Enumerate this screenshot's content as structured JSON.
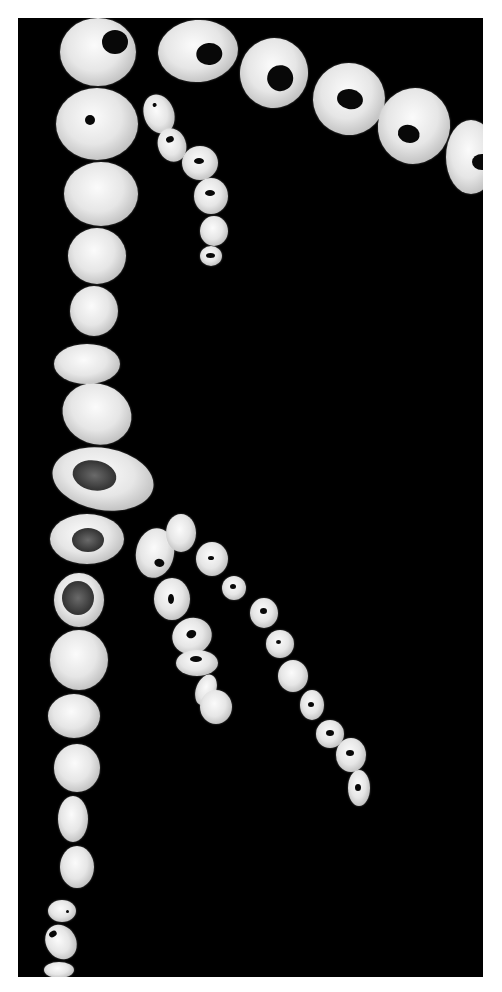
{
  "image": {
    "description": "Photograph of serial arterial cross-section slices arranged in chains on a black background",
    "background": "#000000",
    "border_color": "#ffffff",
    "segment_color": "#e6e6e6",
    "lumen_color": "#080808"
  },
  "chains": [
    {
      "name": "top-row-large-rings",
      "segments": [
        {
          "x": 140,
          "y": 2,
          "w": 80,
          "h": 62,
          "lumen": {
            "x": 38,
            "y": 24,
            "w": 26,
            "h": 22
          },
          "rot": -5
        },
        {
          "x": 222,
          "y": 20,
          "w": 68,
          "h": 70,
          "lumen": {
            "x": 28,
            "y": 26,
            "w": 26,
            "h": 26
          },
          "rot": 10
        },
        {
          "x": 295,
          "y": 45,
          "w": 72,
          "h": 72,
          "lumen": {
            "x": 24,
            "y": 26,
            "w": 26,
            "h": 20
          },
          "rot": 10
        },
        {
          "x": 360,
          "y": 70,
          "w": 72,
          "h": 76,
          "lumen": {
            "x": 22,
            "y": 38,
            "w": 22,
            "h": 18
          },
          "rot": 15
        },
        {
          "x": 428,
          "y": 102,
          "w": 50,
          "h": 74,
          "lumen": {
            "x": 26,
            "y": 34,
            "w": 20,
            "h": 16
          },
          "rot": 0
        }
      ]
    },
    {
      "name": "left-column",
      "segments": [
        {
          "x": 42,
          "y": 0,
          "w": 76,
          "h": 68,
          "lumen": {
            "x": 42,
            "y": 12,
            "w": 26,
            "h": 24
          },
          "rot": 0
        },
        {
          "x": 38,
          "y": 70,
          "w": 82,
          "h": 72,
          "lumen": {
            "x": 29,
            "y": 27,
            "w": 10,
            "h": 10
          },
          "rot": 0
        },
        {
          "x": 46,
          "y": 144,
          "w": 74,
          "h": 64,
          "lumen": null,
          "rot": 0
        },
        {
          "x": 50,
          "y": 210,
          "w": 58,
          "h": 56,
          "lumen": null,
          "rot": 0
        },
        {
          "x": 52,
          "y": 268,
          "w": 48,
          "h": 50,
          "lumen": null,
          "rot": 0
        },
        {
          "x": 36,
          "y": 326,
          "w": 66,
          "h": 40,
          "lumen": null,
          "rot": 0
        },
        {
          "x": 44,
          "y": 366,
          "w": 70,
          "h": 60,
          "lumen": null,
          "rot": 20
        },
        {
          "x": 34,
          "y": 430,
          "w": 102,
          "h": 62,
          "plaque": {
            "x": 20,
            "y": 14,
            "w": 44,
            "h": 30
          },
          "rot": 10
        },
        {
          "x": 32,
          "y": 496,
          "w": 74,
          "h": 50,
          "plaque": {
            "x": 22,
            "y": 14,
            "w": 32,
            "h": 24
          },
          "rot": 0
        },
        {
          "x": 36,
          "y": 555,
          "w": 50,
          "h": 54,
          "plaque": {
            "x": 8,
            "y": 8,
            "w": 32,
            "h": 34
          },
          "rot": 0
        },
        {
          "x": 32,
          "y": 612,
          "w": 58,
          "h": 60,
          "lumen": null,
          "rot": 0
        },
        {
          "x": 30,
          "y": 676,
          "w": 52,
          "h": 44,
          "lumen": null,
          "rot": 0
        },
        {
          "x": 36,
          "y": 726,
          "w": 46,
          "h": 48,
          "lumen": null,
          "rot": 0
        },
        {
          "x": 40,
          "y": 778,
          "w": 30,
          "h": 46,
          "lumen": null,
          "rot": 0
        },
        {
          "x": 42,
          "y": 828,
          "w": 34,
          "h": 42,
          "lumen": null,
          "rot": 0
        },
        {
          "x": 30,
          "y": 882,
          "w": 28,
          "h": 22,
          "lumen": {
            "x": 18,
            "y": 10,
            "w": 3,
            "h": 3
          },
          "rot": 0
        },
        {
          "x": 28,
          "y": 906,
          "w": 30,
          "h": 36,
          "lumen": {
            "x": 8,
            "y": 4,
            "w": 8,
            "h": 6
          },
          "rot": -30
        },
        {
          "x": 26,
          "y": 944,
          "w": 30,
          "h": 16,
          "lumen": null,
          "rot": 0
        }
      ]
    },
    {
      "name": "upper-small-chain",
      "segments": [
        {
          "x": 126,
          "y": 76,
          "w": 30,
          "h": 40,
          "lumen": {
            "x": 12,
            "y": 8,
            "w": 4,
            "h": 4
          },
          "rot": -20
        },
        {
          "x": 140,
          "y": 110,
          "w": 28,
          "h": 34,
          "lumen": {
            "x": 10,
            "y": 8,
            "w": 8,
            "h": 6
          },
          "rot": -20
        },
        {
          "x": 164,
          "y": 128,
          "w": 36,
          "h": 34,
          "lumen": {
            "x": 12,
            "y": 12,
            "w": 10,
            "h": 6
          },
          "rot": 0
        },
        {
          "x": 176,
          "y": 160,
          "w": 34,
          "h": 36,
          "lumen": {
            "x": 11,
            "y": 12,
            "w": 10,
            "h": 6
          },
          "rot": 0
        },
        {
          "x": 182,
          "y": 198,
          "w": 28,
          "h": 30,
          "lumen": null,
          "rot": 0
        },
        {
          "x": 182,
          "y": 228,
          "w": 22,
          "h": 20,
          "lumen": {
            "x": 6,
            "y": 7,
            "w": 9,
            "h": 5
          },
          "rot": 0
        }
      ]
    },
    {
      "name": "middle-chain",
      "segments": [
        {
          "x": 118,
          "y": 510,
          "w": 38,
          "h": 50,
          "lumen": {
            "x": 20,
            "y": 30,
            "w": 10,
            "h": 8
          },
          "rot": 10
        },
        {
          "x": 136,
          "y": 560,
          "w": 36,
          "h": 42,
          "lumen": {
            "x": 14,
            "y": 16,
            "w": 6,
            "h": 10
          },
          "rot": 0
        },
        {
          "x": 154,
          "y": 600,
          "w": 40,
          "h": 36,
          "lumen": {
            "x": 15,
            "y": 12,
            "w": 10,
            "h": 8
          },
          "rot": -20
        },
        {
          "x": 158,
          "y": 632,
          "w": 42,
          "h": 26,
          "lumen": {
            "x": 14,
            "y": 6,
            "w": 12,
            "h": 6
          },
          "rot": 0
        },
        {
          "x": 178,
          "y": 656,
          "w": 20,
          "h": 32,
          "lumen": null,
          "rot": 20
        },
        {
          "x": 182,
          "y": 672,
          "w": 32,
          "h": 34,
          "lumen": null,
          "rot": 0
        }
      ]
    },
    {
      "name": "right-diagonal-chain",
      "segments": [
        {
          "x": 148,
          "y": 496,
          "w": 30,
          "h": 38,
          "lumen": null,
          "rot": 0
        },
        {
          "x": 178,
          "y": 524,
          "w": 32,
          "h": 34,
          "lumen": {
            "x": 12,
            "y": 14,
            "w": 6,
            "h": 4
          },
          "rot": 0
        },
        {
          "x": 204,
          "y": 558,
          "w": 24,
          "h": 24,
          "lumen": {
            "x": 8,
            "y": 8,
            "w": 6,
            "h": 5
          },
          "rot": 0
        },
        {
          "x": 232,
          "y": 580,
          "w": 28,
          "h": 30,
          "lumen": {
            "x": 10,
            "y": 10,
            "w": 7,
            "h": 6
          },
          "rot": 0
        },
        {
          "x": 248,
          "y": 612,
          "w": 28,
          "h": 28,
          "lumen": {
            "x": 10,
            "y": 10,
            "w": 5,
            "h": 4
          },
          "rot": 0
        },
        {
          "x": 260,
          "y": 642,
          "w": 30,
          "h": 32,
          "lumen": null,
          "rot": 0
        },
        {
          "x": 282,
          "y": 672,
          "w": 24,
          "h": 30,
          "lumen": {
            "x": 8,
            "y": 12,
            "w": 6,
            "h": 5
          },
          "rot": 0
        },
        {
          "x": 298,
          "y": 702,
          "w": 28,
          "h": 28,
          "lumen": {
            "x": 10,
            "y": 10,
            "w": 8,
            "h": 6
          },
          "rot": 0
        },
        {
          "x": 318,
          "y": 720,
          "w": 30,
          "h": 34,
          "lumen": {
            "x": 10,
            "y": 12,
            "w": 8,
            "h": 6
          },
          "rot": 0
        },
        {
          "x": 330,
          "y": 752,
          "w": 22,
          "h": 36,
          "lumen": {
            "x": 7,
            "y": 14,
            "w": 6,
            "h": 7
          },
          "rot": 0
        }
      ]
    }
  ]
}
